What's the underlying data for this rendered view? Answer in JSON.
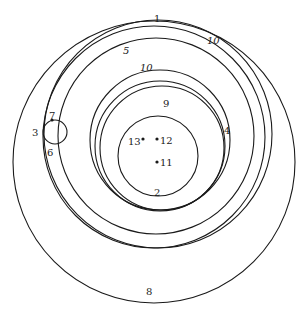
{
  "diagram": {
    "type": "nested-tangent-circles",
    "circles": [
      {
        "id": "outer",
        "cx": 154,
        "cy": 162,
        "r": 141
      },
      {
        "id": "c1a",
        "cx": 158,
        "cy": 134,
        "r": 114
      },
      {
        "id": "c1b",
        "cx": 154,
        "cy": 137,
        "r": 111
      },
      {
        "id": "c5",
        "cx": 156,
        "cy": 136,
        "r": 98
      },
      {
        "id": "c10",
        "cx": 160,
        "cy": 140,
        "r": 70
      },
      {
        "id": "c9",
        "cx": 160,
        "cy": 146,
        "r": 65
      },
      {
        "id": "c9b",
        "cx": 162,
        "cy": 148,
        "r": 62
      },
      {
        "id": "c2",
        "cx": 158,
        "cy": 156,
        "r": 40
      },
      {
        "id": "small",
        "cx": 55,
        "cy": 132,
        "r": 12
      }
    ],
    "points": [
      {
        "id": "p7",
        "x": 52,
        "y": 120
      },
      {
        "id": "p13",
        "x": 143,
        "y": 139
      },
      {
        "id": "p12",
        "x": 157,
        "y": 139
      },
      {
        "id": "p11",
        "x": 157,
        "y": 162
      }
    ],
    "labels": [
      {
        "text": "1",
        "x": 154,
        "y": 22,
        "italic": false
      },
      {
        "text": "10",
        "x": 207,
        "y": 44,
        "italic": true
      },
      {
        "text": "5",
        "x": 123,
        "y": 54,
        "italic": true
      },
      {
        "text": "10",
        "x": 140,
        "y": 71,
        "italic": true
      },
      {
        "text": "9",
        "x": 163,
        "y": 107,
        "italic": false
      },
      {
        "text": "4",
        "x": 224,
        "y": 134,
        "italic": false
      },
      {
        "text": "7",
        "x": 49,
        "y": 119,
        "italic": false
      },
      {
        "text": "3",
        "x": 32,
        "y": 136,
        "italic": false
      },
      {
        "text": "6",
        "x": 47,
        "y": 156,
        "italic": false
      },
      {
        "text": "13",
        "x": 128,
        "y": 145,
        "italic": false
      },
      {
        "text": "12",
        "x": 160,
        "y": 144,
        "italic": false
      },
      {
        "text": "11",
        "x": 160,
        "y": 166,
        "italic": false
      },
      {
        "text": "2",
        "x": 154,
        "y": 196,
        "italic": false
      },
      {
        "text": "8",
        "x": 146,
        "y": 295,
        "italic": false
      }
    ]
  }
}
